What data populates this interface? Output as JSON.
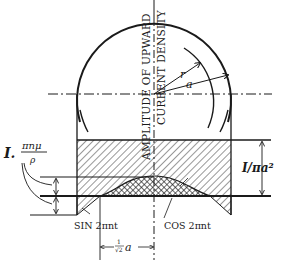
{
  "figure": {
    "vertical_axis_label_line1": "AMPLITUDE OF UPWARD",
    "vertical_axis_label_line2": "CURRENT DENSITY",
    "radius_labels": {
      "inner": "r",
      "outer": "a"
    },
    "left_label": {
      "prefix": "I.",
      "numerator": "πnμ",
      "denominator": "ρ"
    },
    "right_label": "I/πa²",
    "sin_label": "SIN 2πnt",
    "cos_label": "COS 2πnt",
    "distance_label": "a/√2",
    "distance_label_parts": {
      "frac_top": "1",
      "frac_bottom": "√2",
      "var": "a"
    }
  },
  "colors": {
    "ink": "#1a1a1a",
    "paper": "#ffffff"
  }
}
